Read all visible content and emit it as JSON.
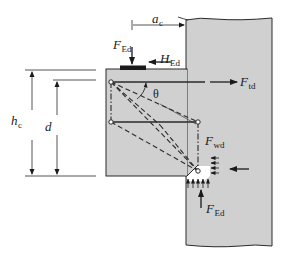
{
  "figure": {
    "colors": {
      "concrete": "#d0d0d0",
      "outline": "#2a2a2a",
      "background": "#ffffff",
      "compression_zone": "#ffffff"
    },
    "labels": {
      "a_c": {
        "main": "a",
        "sub": "c"
      },
      "F_Ed_top": {
        "main": "F",
        "sub": "Ed"
      },
      "H_Ed": {
        "main": "H",
        "sub": "Ed"
      },
      "F_td": {
        "main": "F",
        "sub": "td"
      },
      "theta": {
        "main": "θ"
      },
      "h_c": {
        "main": "h",
        "sub": "c"
      },
      "d": {
        "main": "d"
      },
      "F_wd": {
        "main": "F",
        "sub": "wd"
      },
      "F_Ed_bottom": {
        "main": "F",
        "sub": "Ed"
      }
    },
    "elements": {
      "column": "supporting column (wavy top break line)",
      "corbel": "projecting corbel",
      "bearing_plate": "loaded bearing plate",
      "ties": [
        "main tie (F_td)",
        "secondary horizontal tie",
        "vertical tie (F_wd)"
      ],
      "struts": [
        "inclined compression struts (dashed)",
        "vertical strut (dash-dot)"
      ],
      "nodes": 4,
      "dimensions": [
        "a_c",
        "h_c",
        "d"
      ]
    }
  }
}
